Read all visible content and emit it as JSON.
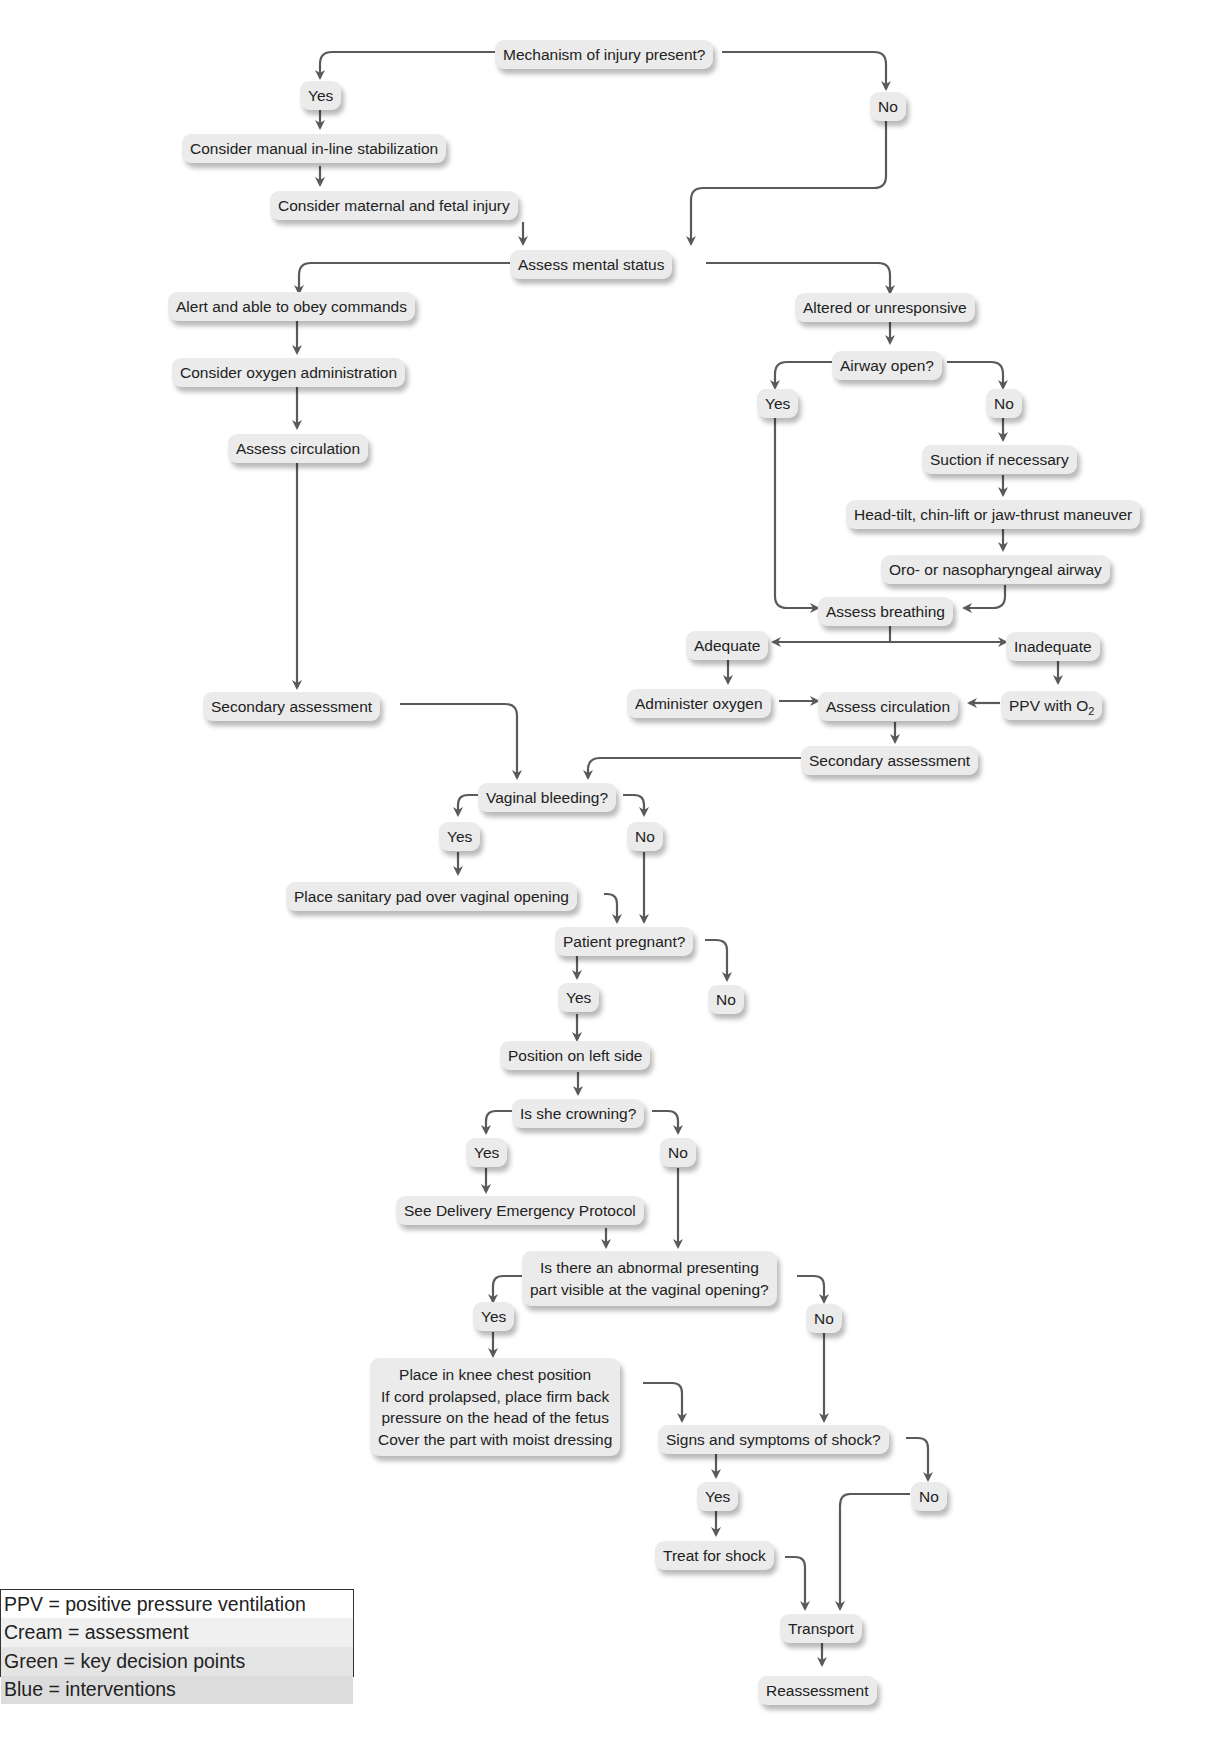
{
  "diagram": {
    "type": "flowchart",
    "nodes": {
      "moi": "Mechanism of injury present?",
      "moi_yes": "Yes",
      "moi_no": "No",
      "stabilize": "Consider manual in-line stabilization",
      "maternal_fetal": "Consider maternal and fetal injury",
      "mental_status": "Assess mental status",
      "alert": "Alert and able to obey commands",
      "oxygen_admin": "Consider oxygen administration",
      "assess_circ_left": "Assess circulation",
      "secondary_left": "Secondary assessment",
      "altered": "Altered or unresponsive",
      "airway_open": "Airway open?",
      "airway_yes": "Yes",
      "airway_no": "No",
      "suction": "Suction if necessary",
      "head_tilt": "Head-tilt, chin-lift or jaw-thrust maneuver",
      "oro_naso": "Oro- or nasopharyngeal airway",
      "assess_breathing": "Assess breathing",
      "adequate": "Adequate",
      "inadequate": "Inadequate",
      "administer_oxygen": "Administer oxygen",
      "assess_circ_right": "Assess circulation",
      "ppv_prefix": "PPV with O",
      "ppv_sub": "2",
      "secondary_right": "Secondary assessment",
      "vaginal_bleeding": "Vaginal bleeding?",
      "vb_yes": "Yes",
      "vb_no": "No",
      "sanitary_pad": "Place sanitary pad over vaginal opening",
      "pregnant": "Patient pregnant?",
      "preg_yes": "Yes",
      "preg_no": "No",
      "left_side": "Position on left side",
      "crowning": "Is she crowning?",
      "crown_yes": "Yes",
      "crown_no": "No",
      "delivery_protocol": "See Delivery Emergency Protocol",
      "abnormal_line1": "Is there an abnormal presenting",
      "abnormal_line2": "part visible at the vaginal opening?",
      "abn_yes": "Yes",
      "abn_no": "No",
      "knee_chest_line1": "Place in knee chest position",
      "knee_chest_line2": "If cord prolapsed, place firm back",
      "knee_chest_line3": "pressure on the head of the fetus",
      "knee_chest_line4": "Cover the part with moist dressing",
      "shock": "Signs and symptoms of shock?",
      "shock_yes": "Yes",
      "shock_no": "No",
      "treat_shock": "Treat for shock",
      "transport": "Transport",
      "reassessment": "Reassessment"
    }
  },
  "legend": {
    "items": [
      "PPV = positive pressure ventilation",
      "Cream = assessment",
      "Green = key decision points",
      "Blue = interventions"
    ]
  },
  "colors": {
    "node_fill": "#ebebeb",
    "arrow": "#5a5a5a",
    "text": "#222222"
  }
}
